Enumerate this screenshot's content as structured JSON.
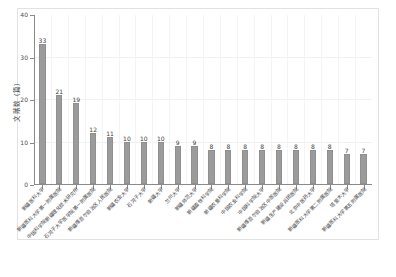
{
  "chart_data": {
    "type": "bar",
    "title": "",
    "subtitle": "",
    "xlabel": "",
    "ylabel": "文献数（篇）",
    "ylim": [
      0,
      40
    ],
    "ytick_labels": [
      "0",
      "10",
      "20",
      "30",
      "40"
    ],
    "ytick_values": [
      0,
      10,
      20,
      30,
      40
    ],
    "grid": true,
    "legend": null,
    "orientation": "vertical",
    "bar_color": "#9b9b9b",
    "bar_edge_color": "#8f8f8f",
    "axis_color": "#8a8a8a",
    "grid_color": "#f1f1f1",
    "text_color": "#3d3d3d",
    "categories": [
      "新疆医科大学",
      "新疆医科大学第一附属医院",
      "中国科学院新疆理化技术研究所",
      "石河子大学医学院第一附属医院",
      "新疆维吾尔自治区人民医院",
      "新疆农业大学",
      "石河子大学",
      "新疆大学",
      "兰州大学",
      "新疆师范大学",
      "新疆畜牧科学院",
      "新疆农垦科学院",
      "中国农业科学院",
      "中国科学院大学",
      "新疆维吾尔自治区中医医院",
      "新疆生产建设兵团医院",
      "北京中医药大学",
      "新疆医科大学第二附属医院",
      "塔里木大学",
      "新疆医科大学第五附属医院"
    ],
    "values": [
      33,
      21,
      19,
      12,
      11,
      10,
      10,
      10,
      9,
      9,
      8,
      8,
      8,
      8,
      8,
      8,
      8,
      8,
      7,
      7
    ],
    "value_labels": [
      "33",
      "21",
      "19",
      "12",
      "11",
      "10",
      "10",
      "10",
      "9",
      "9",
      "8",
      "8",
      "8",
      "8",
      "8",
      "8",
      "8",
      "8",
      "7",
      "7"
    ]
  }
}
